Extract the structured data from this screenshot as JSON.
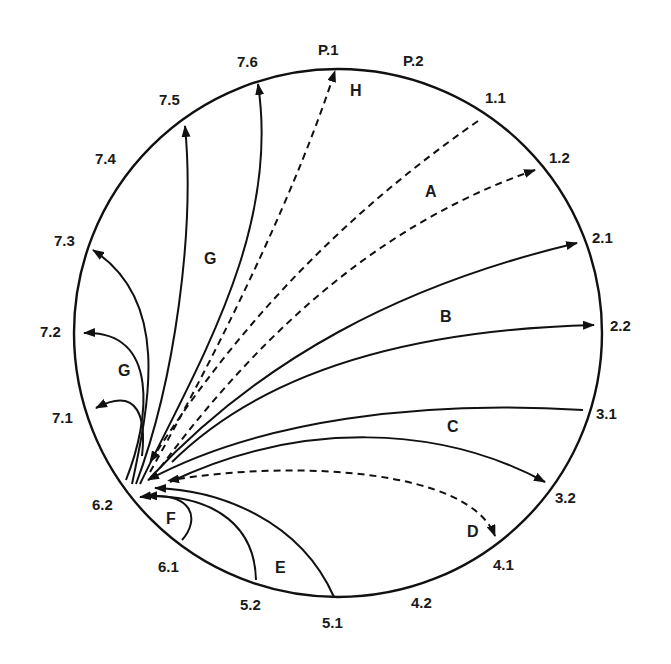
{
  "diagram": {
    "type": "circular-transition-diagram",
    "hub": "6.2",
    "colors": {
      "stroke": "#111111",
      "text": "#1a1a1a",
      "background": "#ffffff"
    },
    "boundary_labels": {
      "p1": "P.1",
      "p2": "P.2",
      "l11": "1.1",
      "l12": "1.2",
      "l21": "2.1",
      "l22": "2.2",
      "l31": "3.1",
      "l32": "3.2",
      "l41": "4.1",
      "l42": "4.2",
      "l51": "5.1",
      "l52": "5.2",
      "l61": "6.1",
      "l62": "6.2",
      "l71": "7.1",
      "l72": "7.2",
      "l73": "7.3",
      "l74": "7.4",
      "l75": "7.5",
      "l76": "7.6"
    },
    "region_labels": {
      "a": "A",
      "b": "B",
      "c": "C",
      "d": "D",
      "e": "E",
      "f": "F",
      "g_upper": "G",
      "g_lower": "G",
      "h": "H"
    },
    "edges": [
      {
        "group": "H",
        "from": "6.2",
        "to": "P.1",
        "style": "dashed",
        "arrow_at": "P.1"
      },
      {
        "group": "A",
        "from": "1.1",
        "to": "6.2",
        "style": "dashed",
        "arrow_at": "6.2"
      },
      {
        "group": "A",
        "from": "6.2",
        "to": "1.2",
        "style": "dashed",
        "arrow_at": "1.2"
      },
      {
        "group": "B",
        "from": "6.2",
        "to": "2.1",
        "style": "solid",
        "arrow_at": "2.1"
      },
      {
        "group": "B",
        "from": "6.2",
        "to": "2.2",
        "style": "solid",
        "arrow_at": "2.2"
      },
      {
        "group": "C",
        "from": "3.1",
        "to": "6.2",
        "style": "solid",
        "arrow_at": "6.2"
      },
      {
        "group": "C",
        "from": "6.2",
        "to": "3.2",
        "style": "solid",
        "arrow_at": "3.2"
      },
      {
        "group": "D",
        "from": "6.2",
        "to": "4.1",
        "style": "dashed",
        "arrow_at": "both"
      },
      {
        "group": "E",
        "from": "5.1",
        "to": "6.2",
        "style": "solid",
        "arrow_at": "6.2"
      },
      {
        "group": "E",
        "from": "5.2",
        "to": "6.2",
        "style": "solid",
        "arrow_at": "6.2"
      },
      {
        "group": "F",
        "from": "6.1",
        "to": "6.2",
        "style": "solid",
        "arrow_at": "6.2"
      },
      {
        "group": "G",
        "from": "6.2",
        "to": "7.1",
        "style": "solid",
        "arrow_at": "7.1"
      },
      {
        "group": "G",
        "from": "6.2",
        "to": "7.2",
        "style": "solid",
        "arrow_at": "7.2"
      },
      {
        "group": "G",
        "from": "6.2",
        "to": "7.3",
        "style": "solid",
        "arrow_at": "7.3"
      },
      {
        "group": "G",
        "from": "6.2",
        "to": "7.5",
        "style": "solid",
        "arrow_at": "7.5"
      },
      {
        "group": "G",
        "from": "6.2",
        "to": "7.6",
        "style": "solid",
        "arrow_at": "7.6"
      }
    ]
  }
}
